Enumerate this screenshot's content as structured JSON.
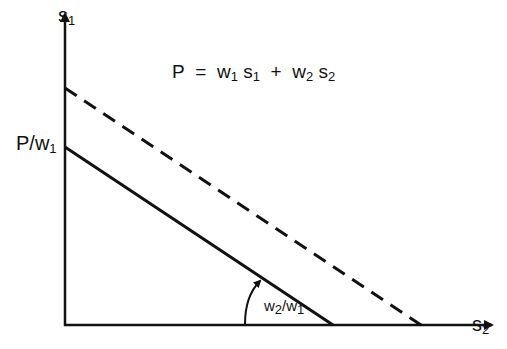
{
  "diagram": {
    "y_axis_label": {
      "main": "s",
      "sub": "1"
    },
    "x_axis_label": {
      "main": "s",
      "sub": "2"
    },
    "equation": {
      "lhs": "P",
      "eq": "=",
      "t1": "w",
      "t1s": "1",
      "t2": "s",
      "t2s": "1",
      "plus": "+",
      "t3": "w",
      "t3s": "2",
      "t4": "s",
      "t4s": "2"
    },
    "intercept_label": {
      "main": "P/w",
      "sub": "1"
    },
    "slope_label": {
      "a": "w",
      "as": "2",
      "slash": "/",
      "b": "w",
      "bs": "1"
    },
    "lines": [
      {
        "name": "budget-line",
        "style": "solid"
      },
      {
        "name": "higher-budget-line",
        "style": "dashed"
      }
    ]
  }
}
